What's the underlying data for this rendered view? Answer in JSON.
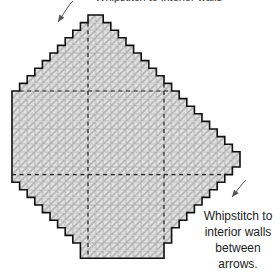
{
  "diagram": {
    "type": "plastic-canvas stitch chart",
    "top_caption": "Whipstitch to interior walls",
    "caption_lines": [
      "Whipstitch to",
      "interior walls",
      "between arrows."
    ],
    "grid": {
      "cell_size": 7.6,
      "origin_x": 12,
      "origin_y": 15,
      "rows": 32,
      "row_spans": [
        [
          10,
          12
        ],
        [
          9,
          13
        ],
        [
          8,
          14
        ],
        [
          7,
          15
        ],
        [
          6,
          16
        ],
        [
          5,
          17
        ],
        [
          4,
          18
        ],
        [
          3,
          19
        ],
        [
          2,
          20
        ],
        [
          1,
          21
        ],
        [
          0,
          22
        ],
        [
          0,
          23
        ],
        [
          0,
          24
        ],
        [
          0,
          25
        ],
        [
          0,
          26
        ],
        [
          0,
          27
        ],
        [
          0,
          28
        ],
        [
          0,
          29
        ],
        [
          0,
          30
        ],
        [
          0,
          30
        ],
        [
          0,
          29
        ],
        [
          0,
          28
        ],
        [
          1,
          27
        ],
        [
          2,
          26
        ],
        [
          3,
          25
        ],
        [
          4,
          24
        ],
        [
          5,
          23
        ],
        [
          6,
          22
        ],
        [
          7,
          21
        ],
        [
          8,
          21
        ],
        [
          9,
          20
        ],
        [
          9,
          20
        ]
      ],
      "dashed_cols": [
        10,
        20
      ],
      "dashed_rows": [
        10,
        21
      ]
    },
    "arrows": [
      {
        "name": "top-left-arrow",
        "x1": 70,
        "y1": 4,
        "x2": 58,
        "y2": 22
      },
      {
        "name": "bottom-right-arrow",
        "x1": 243,
        "y1": 183,
        "x2": 232,
        "y2": 197
      }
    ],
    "colors": {
      "outline": "#111111",
      "stitch_fill": "#c8c8c8",
      "stitch_light": "#eeeeee",
      "grid_line": "#9a9a9a",
      "arrow": "#555555"
    }
  }
}
